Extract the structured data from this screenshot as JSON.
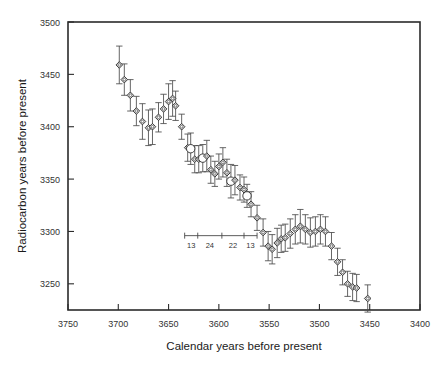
{
  "chart_data": {
    "type": "scatter",
    "title": "",
    "xlabel": "Calendar years before present",
    "ylabel": "Radiocarbon years before present",
    "xlim": [
      3750,
      3400
    ],
    "ylim": [
      3225,
      3500
    ],
    "x_reversed": true,
    "grid": false,
    "legend": "none",
    "xticks": [
      3750,
      3700,
      3650,
      3600,
      3550,
      3500,
      3450,
      3400
    ],
    "xticklabels": [
      "3750",
      "3700",
      "3650",
      "3600",
      "3550",
      "3500",
      "3450",
      "3400"
    ],
    "yticks": [
      3250,
      3300,
      3350,
      3400,
      3450,
      3500
    ],
    "yticklabels": [
      "3250",
      "3300",
      "3350",
      "3400",
      "3450",
      "3500"
    ],
    "error_bar_type": "vertical",
    "marker_shapes": [
      "diamond",
      "circle"
    ],
    "series": [
      {
        "name": "Radiocarbon determinations",
        "points": [
          {
            "x": 3699,
            "y": 3459,
            "err": 18,
            "marker": "diamond"
          },
          {
            "x": 3694,
            "y": 3445,
            "err": 15,
            "marker": "diamond"
          },
          {
            "x": 3688,
            "y": 3430,
            "err": 15,
            "marker": "diamond"
          },
          {
            "x": 3682,
            "y": 3415,
            "err": 14,
            "marker": "diamond"
          },
          {
            "x": 3676,
            "y": 3405,
            "err": 17,
            "marker": "diamond"
          },
          {
            "x": 3670,
            "y": 3399,
            "err": 17,
            "marker": "diamond"
          },
          {
            "x": 3666,
            "y": 3400,
            "err": 17,
            "marker": "diamond"
          },
          {
            "x": 3660,
            "y": 3409,
            "err": 14,
            "marker": "diamond"
          },
          {
            "x": 3655,
            "y": 3417,
            "err": 14,
            "marker": "diamond"
          },
          {
            "x": 3650,
            "y": 3424,
            "err": 17,
            "marker": "diamond"
          },
          {
            "x": 3646,
            "y": 3427,
            "err": 17,
            "marker": "diamond"
          },
          {
            "x": 3643,
            "y": 3420,
            "err": 14,
            "marker": "diamond"
          },
          {
            "x": 3637,
            "y": 3400,
            "err": 12,
            "marker": "diamond"
          },
          {
            "x": 3631,
            "y": 3380,
            "err": 13,
            "marker": "diamond"
          },
          {
            "x": 3628,
            "y": 3379,
            "err": 15,
            "marker": "circle"
          },
          {
            "x": 3624,
            "y": 3369,
            "err": 13,
            "marker": "diamond"
          },
          {
            "x": 3620,
            "y": 3369,
            "err": 13,
            "marker": "diamond"
          },
          {
            "x": 3616,
            "y": 3370,
            "err": 13,
            "marker": "circle"
          },
          {
            "x": 3612,
            "y": 3372,
            "err": 15,
            "marker": "diamond"
          },
          {
            "x": 3608,
            "y": 3359,
            "err": 13,
            "marker": "diamond"
          },
          {
            "x": 3604,
            "y": 3355,
            "err": 12,
            "marker": "diamond"
          },
          {
            "x": 3600,
            "y": 3362,
            "err": 12,
            "marker": "diamond"
          },
          {
            "x": 3596,
            "y": 3366,
            "err": 14,
            "marker": "diamond"
          },
          {
            "x": 3592,
            "y": 3356,
            "err": 13,
            "marker": "diamond"
          },
          {
            "x": 3588,
            "y": 3348,
            "err": 16,
            "marker": "circle"
          },
          {
            "x": 3584,
            "y": 3349,
            "err": 14,
            "marker": "diamond"
          },
          {
            "x": 3579,
            "y": 3342,
            "err": 12,
            "marker": "diamond"
          },
          {
            "x": 3575,
            "y": 3340,
            "err": 12,
            "marker": "diamond"
          },
          {
            "x": 3572,
            "y": 3334,
            "err": 11,
            "marker": "circle"
          },
          {
            "x": 3568,
            "y": 3326,
            "err": 12,
            "marker": "diamond"
          },
          {
            "x": 3562,
            "y": 3313,
            "err": 12,
            "marker": "diamond"
          },
          {
            "x": 3556,
            "y": 3299,
            "err": 13,
            "marker": "diamond"
          },
          {
            "x": 3551,
            "y": 3286,
            "err": 14,
            "marker": "diamond"
          },
          {
            "x": 3547,
            "y": 3283,
            "err": 14,
            "marker": "diamond"
          },
          {
            "x": 3542,
            "y": 3289,
            "err": 14,
            "marker": "diamond"
          },
          {
            "x": 3538,
            "y": 3293,
            "err": 13,
            "marker": "diamond"
          },
          {
            "x": 3534,
            "y": 3294,
            "err": 13,
            "marker": "diamond"
          },
          {
            "x": 3529,
            "y": 3298,
            "err": 14,
            "marker": "diamond"
          },
          {
            "x": 3524,
            "y": 3302,
            "err": 14,
            "marker": "diamond"
          },
          {
            "x": 3519,
            "y": 3305,
            "err": 16,
            "marker": "diamond"
          },
          {
            "x": 3514,
            "y": 3302,
            "err": 14,
            "marker": "diamond"
          },
          {
            "x": 3509,
            "y": 3299,
            "err": 14,
            "marker": "diamond"
          },
          {
            "x": 3504,
            "y": 3300,
            "err": 14,
            "marker": "diamond"
          },
          {
            "x": 3499,
            "y": 3302,
            "err": 14,
            "marker": "diamond"
          },
          {
            "x": 3494,
            "y": 3300,
            "err": 14,
            "marker": "diamond"
          },
          {
            "x": 3488,
            "y": 3286,
            "err": 13,
            "marker": "diamond"
          },
          {
            "x": 3482,
            "y": 3271,
            "err": 13,
            "marker": "diamond"
          },
          {
            "x": 3477,
            "y": 3261,
            "err": 12,
            "marker": "diamond"
          },
          {
            "x": 3472,
            "y": 3250,
            "err": 12,
            "marker": "diamond"
          },
          {
            "x": 3467,
            "y": 3247,
            "err": 13,
            "marker": "diamond"
          },
          {
            "x": 3463,
            "y": 3246,
            "err": 13,
            "marker": "diamond"
          },
          {
            "x": 3452,
            "y": 3236,
            "err": 13,
            "marker": "diamond"
          }
        ]
      }
    ],
    "inset_scale": {
      "description": "wiggle-match segment spacing bar",
      "y_value": 3296,
      "segments": [
        {
          "label": "13",
          "x_start": 3634,
          "x_end": 3621
        },
        {
          "label": "24",
          "x_start": 3621,
          "x_end": 3597
        },
        {
          "label": "22",
          "x_start": 3597,
          "x_end": 3575
        },
        {
          "label": "13",
          "x_start": 3575,
          "x_end": 3562
        }
      ],
      "labels": [
        "13",
        "24",
        "22",
        "13"
      ]
    }
  }
}
